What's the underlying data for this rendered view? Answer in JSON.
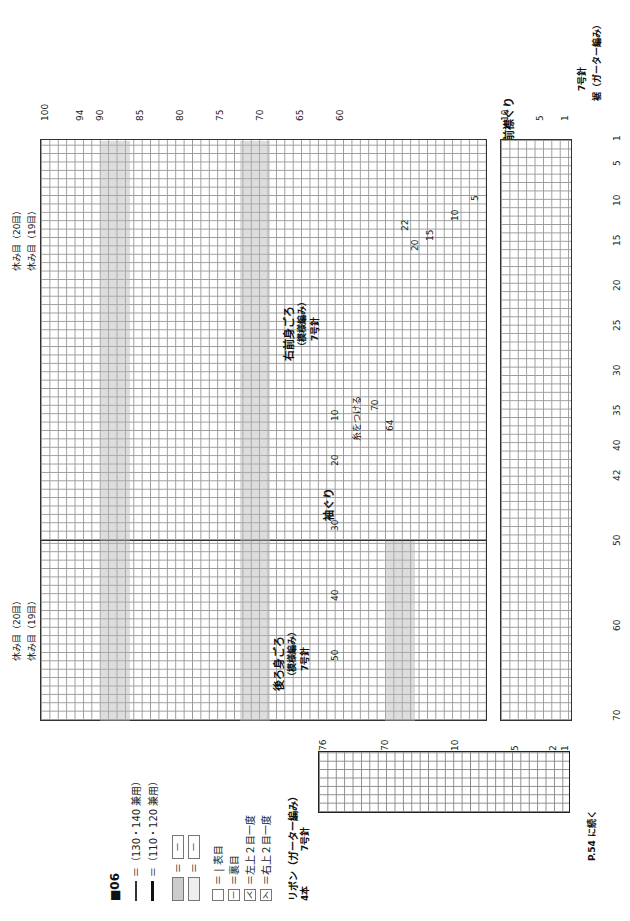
{
  "pattern_id": "■06",
  "legend": {
    "size_lines": [
      {
        "style": "thin",
        "text": "＝（130・140 兼用）"
      },
      {
        "style": "thick",
        "text": "＝（110・120 兼用）"
      }
    ],
    "shade_patterns": [
      {
        "text": "＝"
      },
      {
        "text": "＝"
      }
    ],
    "symbols": [
      {
        "glyph": "",
        "text": "＝ | 表目"
      },
      {
        "glyph": "—",
        "text": "＝裏目"
      },
      {
        "glyph": "⋌",
        "text": "＝左上２目一度"
      },
      {
        "glyph": "⋋",
        "text": "＝右上２目一度"
      }
    ]
  },
  "sections": {
    "right_front": {
      "title": "右前身ごろ",
      "subtitle": "（模様編み）",
      "needle": "7号針"
    },
    "back": {
      "title": "後ろ身ごろ",
      "subtitle": "（模様編み）",
      "needle": "7号針"
    },
    "front_neck": "前襟ぐり",
    "armhole": "袖ぐり",
    "attach_yarn": "糸をつける",
    "hem": {
      "title": "裾（ガーター編み）",
      "needle": "7号針"
    }
  },
  "annotations": {
    "rest_20_front": "休み目（20目）",
    "rest_19_front": "休み目（19目）",
    "rest_20_back": "休み目（20目）",
    "rest_19_back": "休み目（19目）"
  },
  "column_numbers": [
    "1",
    "5",
    "10",
    "15",
    "20",
    "25",
    "30",
    "35",
    "40",
    "42",
    "50",
    "60",
    "70"
  ],
  "row_numbers_top": [
    "1",
    "100",
    "1",
    "94",
    "90",
    "85",
    "80",
    "75",
    "70",
    "65",
    "60",
    "10",
    "5",
    "1",
    "7"
  ],
  "front_neck_steps": [
    "5",
    "5",
    "10",
    "10",
    "15",
    "20",
    "20",
    "22"
  ],
  "back_armhole_rows": [
    "50",
    "40",
    "30",
    "20",
    "10",
    "52",
    "50",
    "40",
    "30",
    "20"
  ],
  "armhole_rows": [
    "10",
    "1",
    "70",
    "1",
    "64"
  ],
  "ribbon": {
    "title": "リボン（ガーター編み）",
    "needle": "7号針",
    "count": "4本",
    "row_labels": [
      "76",
      "70",
      "10",
      "5",
      "2",
      "1"
    ],
    "stitch_labels": [
      "1",
      "4"
    ]
  },
  "continue_note": "P.54 に続く",
  "colors": {
    "grid": "#9a9a9a",
    "shade": "#c8c8c8",
    "outline": "#111111"
  }
}
